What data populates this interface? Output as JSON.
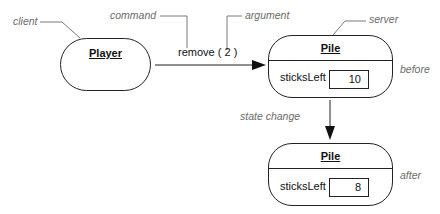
{
  "annotations": {
    "client": "client",
    "command": "command",
    "argument": "argument",
    "server": "server",
    "before": "before",
    "after": "after",
    "state_change": "state change"
  },
  "client_object": {
    "name": "Player"
  },
  "message": {
    "label": "remove ( 2 )",
    "command": "remove",
    "argument": "2"
  },
  "server_before": {
    "name": "Pile",
    "attribute": {
      "label": "sticksLeft",
      "value": "10"
    }
  },
  "server_after": {
    "name": "Pile",
    "attribute": {
      "label": "sticksLeft",
      "value": "8"
    }
  },
  "colors": {
    "line": "#222222",
    "annotation_text": "#6b6b6b",
    "leader_line": "#7a7a7a"
  }
}
